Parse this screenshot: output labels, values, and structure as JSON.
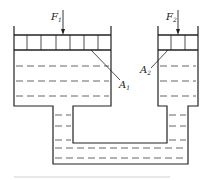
{
  "diagram": {
    "type": "hydraulic-press-communicating-vessels",
    "labels": {
      "force_left": {
        "main": "F",
        "sub": "1"
      },
      "force_right": {
        "main": "F",
        "sub": "2"
      },
      "area_left": {
        "main": "A",
        "sub": "1"
      },
      "area_right": {
        "main": "A",
        "sub": "2"
      }
    },
    "colors": {
      "stroke": "#222222",
      "dash": "#555555",
      "caption_bar": "#e8e8e8"
    }
  }
}
